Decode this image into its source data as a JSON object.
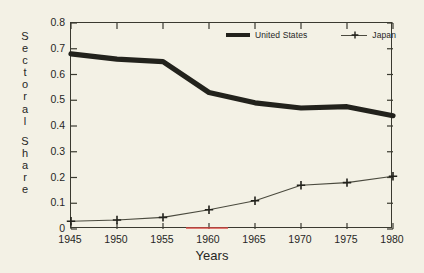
{
  "chart_data": {
    "type": "line",
    "title": "",
    "xlabel": "Years",
    "ylabel": "Sectoral Share",
    "x": [
      1945,
      1950,
      1955,
      1960,
      1965,
      1970,
      1975,
      1980
    ],
    "xtick_labels": [
      "1945",
      "1950",
      "1955",
      "1960",
      "1965",
      "1970",
      "1975",
      "1980"
    ],
    "ytick_labels": [
      "0",
      "0.1",
      "0.2",
      "0.3",
      "0.4",
      "0.5",
      "0.6",
      "0.7",
      "0.8"
    ],
    "ytick_values": [
      0,
      0.1,
      0.2,
      0.3,
      0.4,
      0.5,
      0.6,
      0.7,
      0.8
    ],
    "xlim": [
      1945,
      1980
    ],
    "ylim": [
      0,
      0.8
    ],
    "grid": false,
    "legend_position": "top-right-inside",
    "series": [
      {
        "name": "United States",
        "marker": "none",
        "line_style": "thick-solid",
        "color": "#22221c",
        "values": [
          0.68,
          0.66,
          0.65,
          0.53,
          0.49,
          0.47,
          0.475,
          0.44
        ]
      },
      {
        "name": "Japan",
        "marker": "plus",
        "line_style": "thin-solid",
        "color": "#4a4a3e",
        "values": [
          0.03,
          0.035,
          0.045,
          0.075,
          0.11,
          0.17,
          0.18,
          0.205
        ]
      }
    ]
  },
  "axes": {
    "y_title_letters": [
      "S",
      "e",
      "c",
      "t",
      "o",
      "r",
      "a",
      "l",
      "S",
      "h",
      "a",
      "r",
      "e"
    ],
    "y_title_text": "Sectoral Share",
    "x_title_text": "Years"
  },
  "legend": {
    "items": [
      {
        "label": "United States"
      },
      {
        "label": "Japan"
      }
    ]
  },
  "colors": {
    "background": "#f3f1e5",
    "axis": "#3a3a30",
    "text": "#26261f",
    "us_line": "#22221c",
    "japan_line": "#4a4a3e",
    "artifact_red": "#d94a44"
  }
}
